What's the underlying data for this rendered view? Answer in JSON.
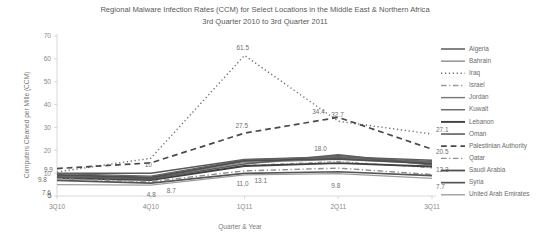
{
  "chart_data": {
    "type": "line",
    "title": "Regional Malware Infection Rates (CCM) for Select Locations in the Middle East & Northern Africa",
    "subtitle": "3rd Quarter 2010 to 3rd Quarter 2011",
    "xlabel": "Quarter & Year",
    "ylabel": "Computers Cleaned per Mille (CCM)",
    "categories": [
      "3Q10",
      "4Q10",
      "1Q11",
      "2Q11",
      "3Q11"
    ],
    "ylim": [
      0,
      70
    ],
    "yticks": [
      0,
      10,
      20,
      30,
      40,
      50,
      60,
      70
    ],
    "grid": false,
    "legend_position": "right",
    "series": [
      {
        "name": "Algeria",
        "values": [
          9.9,
          10.0,
          16.0,
          17.2,
          15.6
        ],
        "style": "solid",
        "color": "#5a5a5a",
        "width": 1.5
      },
      {
        "name": "Bahrain",
        "values": [
          8.6,
          7.9,
          14.6,
          16.0,
          14.0
        ],
        "style": "solid",
        "color": "#8c8c8c",
        "width": 1.2
      },
      {
        "name": "Iraq",
        "values": [
          10.5,
          16.5,
          61.5,
          32.7,
          27.1
        ],
        "style": "dotted",
        "color": "#6f6f6f",
        "width": 1.4
      },
      {
        "name": "Israel",
        "values": [
          8.2,
          7.2,
          13.4,
          15.1,
          12.3
        ],
        "style": "dashdot",
        "color": "#9a9a9a",
        "width": 1.1
      },
      {
        "name": "Jordan",
        "values": [
          9.0,
          8.3,
          15.2,
          16.6,
          14.8
        ],
        "style": "solid",
        "color": "#777777",
        "width": 1.2
      },
      {
        "name": "Kuwait",
        "values": [
          9.8,
          8.7,
          15.8,
          17.0,
          15.1
        ],
        "style": "solid",
        "color": "#666666",
        "width": 1.4
      },
      {
        "name": "Lebanon",
        "values": [
          7.9,
          7.0,
          13.1,
          14.4,
          12.9
        ],
        "style": "solid",
        "color": "#3f3f3f",
        "width": 1.9
      },
      {
        "name": "Oman",
        "values": [
          8.4,
          7.5,
          14.0,
          18.0,
          13.6
        ],
        "style": "solid",
        "color": "#5e5e5e",
        "width": 1.6
      },
      {
        "name": "Palestinian Authority",
        "values": [
          12.0,
          14.5,
          27.5,
          34.4,
          20.5
        ],
        "style": "dashed",
        "color": "#4a4a4a",
        "width": 1.7
      },
      {
        "name": "Qatar",
        "values": [
          7.6,
          6.3,
          11.0,
          12.2,
          9.4
        ],
        "style": "dashdot",
        "color": "#8f8f8f",
        "width": 1.4
      },
      {
        "name": "Saudi Arabia",
        "values": [
          9.2,
          8.0,
          15.4,
          16.2,
          14.3
        ],
        "style": "solid",
        "color": "#4f4f4f",
        "width": 1.8
      },
      {
        "name": "Syria",
        "values": [
          6.8,
          5.6,
          9.9,
          10.6,
          8.9
        ],
        "style": "solid",
        "color": "#555555",
        "width": 1.7
      },
      {
        "name": "United Arab Emirates",
        "values": [
          5.0,
          4.8,
          9.2,
          9.8,
          7.7
        ],
        "style": "solid",
        "color": "#9e9e9e",
        "width": 1.2
      }
    ],
    "point_labels": [
      {
        "text": "9.9",
        "x": 0,
        "y": 9.9,
        "dx": -13,
        "dy": -1
      },
      {
        "text": "9.8",
        "x": 0,
        "y": 9.8,
        "dx": -19,
        "dy": 8
      },
      {
        "text": "7.6",
        "x": 0,
        "y": 7.6,
        "dx": -15,
        "dy": 16
      },
      {
        "text": "5",
        "x": 0,
        "y": 5.0,
        "dx": -9,
        "dy": 13
      },
      {
        "text": "10",
        "x": 1,
        "y": 10.0,
        "dx": -6,
        "dy": -6
      },
      {
        "text": "4.8",
        "x": 1,
        "y": 4.8,
        "dx": -4,
        "dy": 12
      },
      {
        "text": "8.7",
        "x": 1,
        "y": 8.7,
        "dx": 16,
        "dy": 17
      },
      {
        "text": "61.5",
        "x": 2,
        "y": 61.5,
        "dx": -8,
        "dy": -5
      },
      {
        "text": "27.5",
        "x": 2,
        "y": 27.5,
        "dx": -9,
        "dy": -5
      },
      {
        "text": "11.0",
        "x": 2,
        "y": 11.0,
        "dx": -8,
        "dy": 15
      },
      {
        "text": "13.1",
        "x": 2,
        "y": 13.1,
        "dx": 10,
        "dy": 17
      },
      {
        "text": "32.7",
        "x": 3,
        "y": 32.7,
        "dx": -7,
        "dy": -4
      },
      {
        "text": "34.4",
        "x": 3,
        "y": 34.4,
        "dx": -26,
        "dy": -3
      },
      {
        "text": "18.0",
        "x": 3,
        "y": 18.0,
        "dx": -24,
        "dy": -4
      },
      {
        "text": "9.8",
        "x": 3,
        "y": 9.8,
        "dx": -7,
        "dy": 14
      },
      {
        "text": "27.1",
        "x": 4,
        "y": 27.1,
        "dx": 4,
        "dy": -2
      },
      {
        "text": "20.5",
        "x": 4,
        "y": 20.5,
        "dx": 4,
        "dy": 5
      },
      {
        "text": "12.3",
        "x": 4,
        "y": 12.3,
        "dx": 4,
        "dy": 4
      },
      {
        "text": "7.7",
        "x": 4,
        "y": 7.7,
        "dx": 4,
        "dy": 11
      }
    ]
  }
}
